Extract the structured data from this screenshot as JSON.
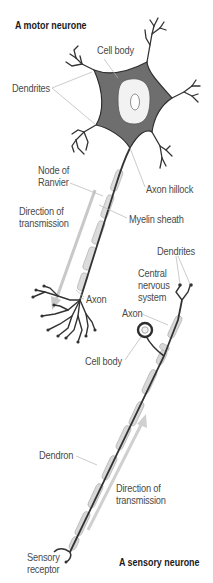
{
  "titles": {
    "motor": "A motor neurone",
    "sensory": "A sensory neurone"
  },
  "motor_labels": {
    "cell_body": "Cell body",
    "dendrites": "Dendrites",
    "node_line1": "Node of",
    "node_line2": "Ranvier",
    "axon_hillock": "Axon hillock",
    "direction_line1": "Direction of",
    "direction_line2": "transmission",
    "myelin_sheath": "Myelin sheath",
    "axon": "Axon"
  },
  "sensory_labels": {
    "dendrites": "Dendrites",
    "cns_line1": "Central",
    "cns_line2": "nervous",
    "cns_line3": "system",
    "axon": "Axon",
    "cell_body": "Cell body",
    "dendron": "Dendron",
    "direction_line1": "Direction of",
    "direction_line2": "transmission",
    "receptor_line1": "Sensory",
    "receptor_line2": "receptor"
  },
  "colors": {
    "cell_fill": "#6e6e6e",
    "outline": "#2e2e2e",
    "nucleus_fill": "#f2f2f2",
    "myelin_fill": "#d6d6d6",
    "arrow": "#c4c4c4",
    "leader": "#b5b5b5",
    "label_text": "#4a4a4a"
  }
}
